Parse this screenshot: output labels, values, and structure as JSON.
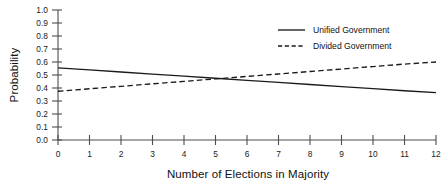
{
  "chart_data": {
    "type": "line",
    "title": "",
    "xlabel": "Number of Elections in Majority",
    "ylabel": "Probability",
    "xlim": [
      0,
      12
    ],
    "ylim": [
      0.0,
      1.0
    ],
    "grid": false,
    "legend_position": "top-right",
    "x_ticks": [
      "0",
      "1",
      "2",
      "3",
      "4",
      "5",
      "6",
      "7",
      "8",
      "9",
      "10",
      "11",
      "12"
    ],
    "x_tick_values": [
      0,
      1,
      2,
      3,
      4,
      5,
      6,
      7,
      8,
      9,
      10,
      11,
      12
    ],
    "y_ticks": [
      "0.0",
      "0.1",
      "0.2",
      "0.3",
      "0.4",
      "0.5",
      "0.6",
      "0.7",
      "0.8",
      "0.9",
      "1.0"
    ],
    "y_tick_values": [
      0.0,
      0.1,
      0.2,
      0.3,
      0.4,
      0.5,
      0.6,
      0.7,
      0.8,
      0.9,
      1.0
    ],
    "x": [
      0,
      1,
      2,
      3,
      4,
      5,
      6,
      7,
      8,
      9,
      10,
      11,
      12
    ],
    "series": [
      {
        "name": "Unified Government",
        "style": "solid",
        "color": "#1a1a1a",
        "values": [
          0.555,
          0.539,
          0.523,
          0.507,
          0.491,
          0.475,
          0.459,
          0.443,
          0.427,
          0.411,
          0.395,
          0.379,
          0.365
        ]
      },
      {
        "name": "Divided Government",
        "style": "dashed",
        "color": "#1a1a1a",
        "values": [
          0.375,
          0.394,
          0.413,
          0.432,
          0.451,
          0.47,
          0.489,
          0.508,
          0.527,
          0.546,
          0.565,
          0.584,
          0.6
        ]
      }
    ],
    "annotations": []
  },
  "legend": {
    "entries": [
      {
        "label": "Unified Government",
        "style": "solid"
      },
      {
        "label": "Divided Government",
        "style": "dashed"
      }
    ]
  }
}
